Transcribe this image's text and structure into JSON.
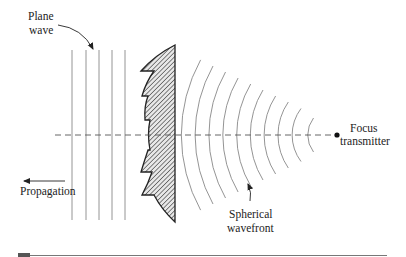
{
  "figure": {
    "type": "diagram",
    "labels": {
      "plane_wave_line1": "Plane",
      "plane_wave_line2": "wave",
      "propagation": "Propagation",
      "focus_line1": "Focus",
      "focus_line2": "transmitter",
      "spherical_line1": "Spherical",
      "spherical_line2": "wavefront"
    },
    "elements": {
      "plane_wave_lines": 5,
      "spherical_wavefront_arcs": 10,
      "lens_steps": 5,
      "lens_fill": "diagonal hatch"
    },
    "colors": {
      "ink": "#222222",
      "light_line": "#777777",
      "hatch": "#555555",
      "rule": "#666666"
    }
  }
}
